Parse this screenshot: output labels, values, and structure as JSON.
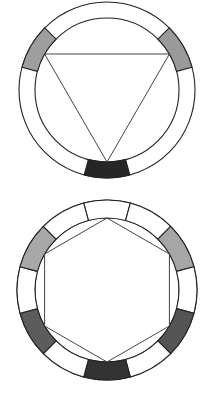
{
  "diagrams": [
    {
      "name": "triad-color-wheel",
      "center": [
        107,
        90
      ],
      "outer_radius": 88,
      "inner_radius": 72,
      "segment_span_deg": 30,
      "dividers": false,
      "segments": [
        {
          "angle": 150,
          "fill": "#9e9e9e"
        },
        {
          "angle": 30,
          "fill": "#9a9a9a"
        },
        {
          "angle": 270,
          "fill": "#262626"
        }
      ],
      "polygon": {
        "shape": "triangle",
        "sides": 3,
        "start_angle": 270,
        "vertex_angles": [
          150,
          30,
          270
        ]
      }
    },
    {
      "name": "hexad-color-wheel",
      "center": [
        107,
        290
      ],
      "outer_radius": 90,
      "inner_radius": 72,
      "segment_span_deg": 30,
      "dividers": true,
      "segments": [
        {
          "angle": 90,
          "fill": "#ffffff"
        },
        {
          "angle": 60,
          "fill": "#ffffff"
        },
        {
          "angle": 30,
          "fill": "#a6a6a6"
        },
        {
          "angle": 0,
          "fill": "#ffffff"
        },
        {
          "angle": 330,
          "fill": "#555555"
        },
        {
          "angle": 300,
          "fill": "#ffffff"
        },
        {
          "angle": 270,
          "fill": "#333333"
        },
        {
          "angle": 240,
          "fill": "#ffffff"
        },
        {
          "angle": 210,
          "fill": "#5c5c5c"
        },
        {
          "angle": 180,
          "fill": "#ffffff"
        },
        {
          "angle": 150,
          "fill": "#a8a8a8"
        },
        {
          "angle": 120,
          "fill": "#ffffff"
        }
      ],
      "polygon": {
        "shape": "hexagon",
        "sides": 6,
        "vertex_angles": [
          90,
          30,
          330,
          270,
          210,
          150
        ]
      }
    }
  ]
}
